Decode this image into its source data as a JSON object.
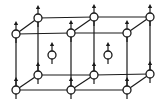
{
  "diagram": {
    "colors": {
      "line": "#1a1a1a",
      "node_fill": "#ffffff",
      "background": "#ffffff"
    },
    "node_radius": 4,
    "nodes": [
      {
        "id": "ftl",
        "x": 16,
        "y": 34,
        "spin": "up"
      },
      {
        "id": "ftm",
        "x": 71,
        "y": 33,
        "spin": "up"
      },
      {
        "id": "ftr",
        "x": 127,
        "y": 33,
        "spin": "up"
      },
      {
        "id": "btl",
        "x": 38,
        "y": 18,
        "spin": "up"
      },
      {
        "id": "btm",
        "x": 94,
        "y": 17,
        "spin": "up"
      },
      {
        "id": "btr",
        "x": 150,
        "y": 17,
        "spin": "up"
      },
      {
        "id": "fbl",
        "x": 16,
        "y": 90,
        "spin": "up"
      },
      {
        "id": "fbm",
        "x": 71,
        "y": 90,
        "spin": "up"
      },
      {
        "id": "fbr",
        "x": 127,
        "y": 90,
        "spin": "up"
      },
      {
        "id": "bbl",
        "x": 38,
        "y": 75,
        "spin": "up"
      },
      {
        "id": "bbm",
        "x": 94,
        "y": 75,
        "spin": "up"
      },
      {
        "id": "bbr",
        "x": 150,
        "y": 74,
        "spin": "up"
      },
      {
        "id": "c1",
        "x": 52,
        "y": 55,
        "spin": "up",
        "body_center": true
      },
      {
        "id": "c2",
        "x": 108,
        "y": 55,
        "spin": "up",
        "body_center": true
      }
    ],
    "edges": [
      [
        "ftl",
        "ftm"
      ],
      [
        "ftm",
        "ftr"
      ],
      [
        "btl",
        "btm"
      ],
      [
        "btm",
        "btr"
      ],
      [
        "fbl",
        "fbm"
      ],
      [
        "fbm",
        "fbr"
      ],
      [
        "bbl",
        "bbm"
      ],
      [
        "bbm",
        "bbr"
      ],
      [
        "ftl",
        "btl"
      ],
      [
        "ftm",
        "btm"
      ],
      [
        "ftr",
        "btr"
      ],
      [
        "fbl",
        "bbl"
      ],
      [
        "fbm",
        "bbm"
      ],
      [
        "fbr",
        "bbr"
      ],
      [
        "ftl",
        "fbl"
      ],
      [
        "ftm",
        "fbm"
      ],
      [
        "ftr",
        "fbr"
      ],
      [
        "btl",
        "bbl"
      ],
      [
        "btm",
        "bbm"
      ],
      [
        "btr",
        "bbr"
      ]
    ],
    "arrow": {
      "length": 13,
      "head_size": 3,
      "tail_length": 9
    }
  }
}
